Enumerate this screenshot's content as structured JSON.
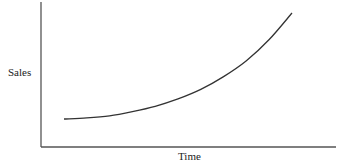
{
  "chart_data": {
    "type": "line",
    "title": "",
    "xlabel": "Time",
    "ylabel": "Sales",
    "grid": false,
    "legend": null,
    "x_ticks": [],
    "y_ticks": [],
    "series": [
      {
        "name": "Sales",
        "x": [
          0,
          0.1,
          0.2,
          0.3,
          0.4,
          0.5,
          0.6,
          0.7,
          0.8,
          0.9,
          1.0
        ],
        "values": [
          0.0,
          0.01,
          0.03,
          0.07,
          0.12,
          0.19,
          0.28,
          0.4,
          0.55,
          0.75,
          1.0
        ]
      }
    ],
    "colors": {
      "line": "#333333",
      "axis": "#555555"
    }
  }
}
